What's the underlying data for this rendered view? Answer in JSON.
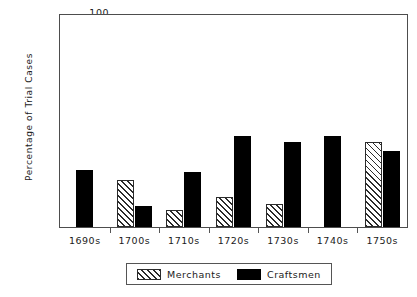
{
  "chart_data": {
    "type": "bar",
    "title": "",
    "xlabel": "",
    "ylabel": "Percentage of Trial Cases",
    "categories": [
      "1690s",
      "1700s",
      "1710s",
      "1720s",
      "1730s",
      "1740s",
      "1750s"
    ],
    "series": [
      {
        "name": "Merchants",
        "color": "#ffffff",
        "pattern": "diagonal-hatch",
        "values": [
          0,
          22,
          8,
          14,
          11,
          0,
          40
        ]
      },
      {
        "name": "Craftsmen",
        "color": "#000000",
        "pattern": "solid",
        "values": [
          27,
          10,
          26,
          43,
          40,
          43,
          36
        ]
      }
    ],
    "ylim": [
      0,
      100
    ],
    "ytick_values": [
      0,
      10,
      20,
      30,
      40,
      50,
      60,
      70,
      80,
      90,
      100
    ],
    "ytick_labels": [
      "0",
      "10",
      "20",
      "30",
      "40",
      "50",
      "60",
      "70",
      "80",
      "90",
      "100"
    ],
    "grid": false,
    "legend_position": "bottom-center"
  },
  "legend": {
    "items": [
      {
        "label": "Merchants",
        "swatch": "merchants"
      },
      {
        "label": "Craftsmen",
        "swatch": "craftsmen"
      }
    ]
  }
}
